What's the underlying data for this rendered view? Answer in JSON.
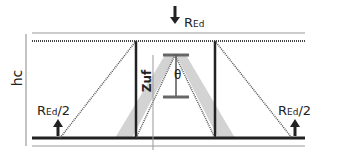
{
  "diagram": {
    "labels": {
      "load_top": {
        "main": "R",
        "sub": "Ed",
        "suffix": ""
      },
      "reaction_left": {
        "main": "R",
        "sub": "Ed",
        "suffix": "/2"
      },
      "reaction_right": {
        "main": "R",
        "sub": "Ed",
        "suffix": "/2"
      },
      "height": "hc",
      "lever_arm": "Zuf",
      "angle": "θ"
    },
    "colors": {
      "line": "#222222",
      "strut_fill": "#d3d3d3",
      "dotted": "#555555",
      "thin": "#999999"
    },
    "icons": {
      "load_arrow": "arrow-down-icon",
      "reaction_arrow": "arrow-up-icon"
    }
  }
}
